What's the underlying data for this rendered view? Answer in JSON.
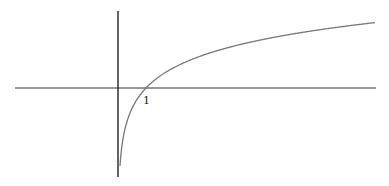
{
  "chart_data": {
    "type": "line",
    "title": "",
    "xlabel": "",
    "ylabel": "",
    "function": "y = ln(x)",
    "series": [
      {
        "name": "ln(x)",
        "x": [
          0.07,
          0.1,
          0.2,
          0.3,
          0.5,
          0.75,
          1,
          1.5,
          2,
          3,
          4,
          5,
          6,
          7,
          8,
          9,
          9.2
        ],
        "values": [
          -2.66,
          -2.3,
          -1.61,
          -1.2,
          -0.69,
          -0.29,
          0,
          0.41,
          0.69,
          1.1,
          1.39,
          1.61,
          1.79,
          1.95,
          2.08,
          2.2,
          2.22
        ]
      }
    ],
    "tick_labels": {
      "x": [
        "1"
      ]
    },
    "axis_ranges": {
      "x": [
        -3.7,
        9.2
      ],
      "y": [
        -3.0,
        2.7
      ]
    },
    "grid": false,
    "legend": false,
    "colors": {
      "axes": "#222222",
      "curve": "#777777"
    }
  },
  "labels": {
    "x_tick_1": "1"
  }
}
